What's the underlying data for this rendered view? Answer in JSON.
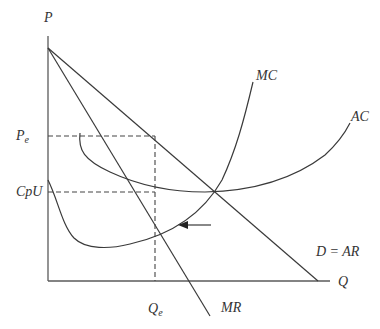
{
  "diagram": {
    "axes": {
      "y_label": "P",
      "x_label": "Q"
    },
    "levels": {
      "pe_label": "P",
      "pe_sub": "e",
      "cpu_label": "CpU",
      "qe_label": "Q",
      "qe_sub": "e"
    },
    "curves": {
      "mc_label": "MC",
      "ac_label": "AC",
      "demand_label": "D = AR",
      "mr_label": "MR"
    },
    "annotations": {
      "arrow": "left-pointing arrow toward MR=MC intersection"
    }
  }
}
